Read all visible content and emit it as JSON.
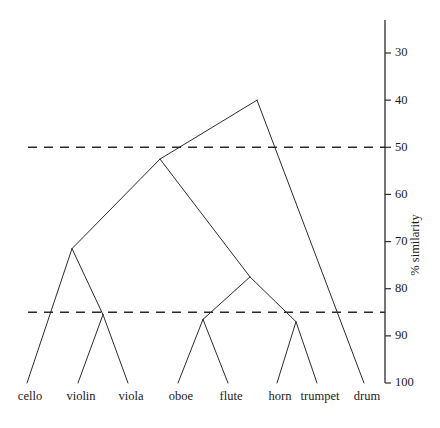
{
  "chart_data": {
    "type": "dendrogram",
    "title": "",
    "xlabel": "",
    "ylabel": "% similarity",
    "ylim": [
      25,
      100
    ],
    "y_inverted": true,
    "grid": false,
    "legend": null,
    "y_ticks": [
      30,
      40,
      50,
      60,
      70,
      80,
      90,
      100
    ],
    "y_tick_labels": [
      "30",
      "40",
      "50",
      "60",
      "70",
      "80",
      "90",
      "100"
    ],
    "leaves": [
      {
        "label": "cello",
        "x": 27
      },
      {
        "label": "violin",
        "x": 78
      },
      {
        "label": "viola",
        "x": 128
      },
      {
        "label": "oboe",
        "x": 178
      },
      {
        "label": "flute",
        "x": 228
      },
      {
        "label": "horn",
        "x": 277
      },
      {
        "label": "trumpet",
        "x": 317
      },
      {
        "label": "drum",
        "x": 364
      }
    ],
    "leaf_similarity": 100,
    "merges": [
      {
        "id": "m1",
        "name": "violin-viola",
        "children": [
          "violin",
          "viola"
        ],
        "similarity": 85.5,
        "x": 103
      },
      {
        "id": "m2",
        "name": "strings-bowed",
        "children": [
          "cello",
          "m1"
        ],
        "similarity": 71.5,
        "x": 72
      },
      {
        "id": "m3",
        "name": "oboe-flute",
        "children": [
          "oboe",
          "flute"
        ],
        "similarity": 86.5,
        "x": 203
      },
      {
        "id": "m4",
        "name": "horn-trumpet",
        "children": [
          "horn",
          "trumpet"
        ],
        "similarity": 87.0,
        "x": 296
      },
      {
        "id": "m5",
        "name": "winds",
        "children": [
          "m3",
          "m4"
        ],
        "similarity": 77.5,
        "x": 250
      },
      {
        "id": "m6",
        "name": "strings-winds",
        "children": [
          "m2",
          "m5"
        ],
        "similarity": 52.5,
        "x": 160
      },
      {
        "id": "m7",
        "name": "root",
        "children": [
          "m6",
          "drum"
        ],
        "similarity": 40.0,
        "x": 257
      }
    ],
    "thresholds": [
      {
        "name": "upper-threshold",
        "similarity": 50,
        "style": "dashed"
      },
      {
        "name": "lower-threshold",
        "similarity": 85,
        "style": "dashed"
      }
    ],
    "axis": {
      "x_px": 385,
      "top_px": 20,
      "bottom_px": 383,
      "tick_len_px": 6,
      "title_x_px": 419,
      "title_y_px": 245
    },
    "plot": {
      "leaf_baseline_px": 383,
      "label_baseline_px": 400,
      "threshold_start_px": 28,
      "threshold_end_px": 385
    },
    "colors": {
      "line": "#2b2b2b",
      "text": "#1a1a1a",
      "background": "#ffffff"
    }
  }
}
